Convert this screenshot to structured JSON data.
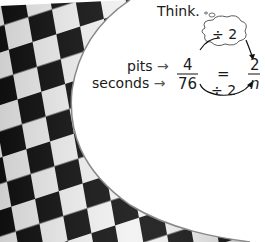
{
  "think_label": "Think.",
  "top_operation": "÷ 2",
  "bottom_operation": "÷ 2",
  "row_labels": {
    "top": "pits",
    "bottom": "seconds"
  },
  "left_fraction": {
    "numerator": "4",
    "denominator": "76"
  },
  "equals": "=",
  "right_fraction": {
    "numerator": "2",
    "denominator": "n"
  },
  "arrow_glyph": "→"
}
